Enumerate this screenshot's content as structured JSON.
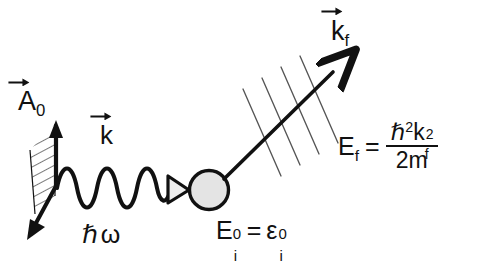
{
  "diagram": {
    "background": "#ffffff",
    "ink": "#111111",
    "sphere_fill": "#e4e4e4",
    "hatch_color": "#3a3a3a"
  },
  "labels": {
    "vector_potential": {
      "symbol": "A",
      "subscript": "0",
      "has_vector_arrow": true
    },
    "incident_wavevector": {
      "symbol": "k",
      "has_vector_arrow": true
    },
    "photon_energy": {
      "text": "ℏω"
    },
    "final_wavevector": {
      "symbol": "k",
      "subscript": "f",
      "has_vector_arrow": true
    },
    "initial_energy": {
      "lhs_symbol": "E",
      "lhs_sup": "0",
      "lhs_sub": "i",
      "equals": "=",
      "rhs_symbol": "ε",
      "rhs_sup": "0",
      "rhs_sub": "i"
    },
    "final_energy": {
      "lhs_symbol": "E",
      "lhs_sub": "f",
      "equals": "=",
      "numerator_hbar": "ℏ",
      "numerator_hbar_pow": "2",
      "numerator_k": "k",
      "numerator_k_sub": "f",
      "numerator_k_pow": "2",
      "denominator": "2m"
    }
  },
  "elements": {
    "polarization_plane": "hatched parallelogram",
    "incident_photon": "sinusoidal wave with 5 cycles",
    "target_atom": "shaded circle",
    "crystal_planes": "four thin parallel diagonal lines",
    "outgoing_electron": "straight arrow to upper right"
  },
  "counts": {
    "wave_cycles": 5,
    "hatch_lines": 7,
    "crystal_plane_lines": 4
  }
}
